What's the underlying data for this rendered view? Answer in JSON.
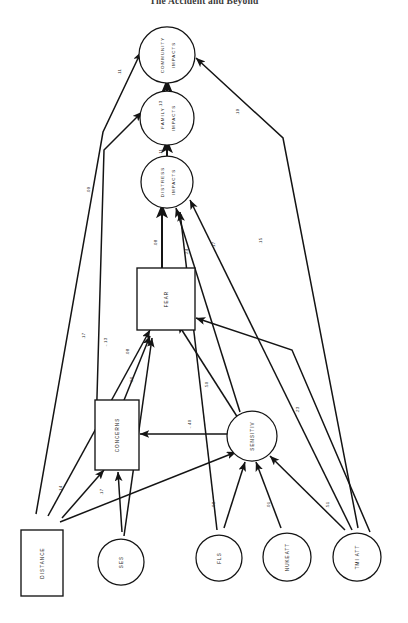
{
  "page": {
    "running_head": "The Accident and Beyond",
    "figure_type": "structural-equation-path-diagram",
    "orientation": "rotated-90-counterclockwise"
  },
  "diagram": {
    "nodes": [
      {
        "id": "community_impacts",
        "label": "COMMUNITY IMPACTS",
        "shape": "circle",
        "line1": "COMMUNITY",
        "line2": "IMPACTS"
      },
      {
        "id": "family_impacts",
        "label": "FAMILY IMPACTS",
        "shape": "circle",
        "line1": "FAMILY",
        "line2": "IMPACTS"
      },
      {
        "id": "distress_impacts",
        "label": "DISTRESS IMPACTS",
        "shape": "circle",
        "line1": "DISTRESS",
        "line2": "IMPACTS"
      },
      {
        "id": "fear",
        "label": "FEAR",
        "shape": "rect",
        "line1": "FEAR",
        "line2": ""
      },
      {
        "id": "concerns",
        "label": "CONCERNS",
        "shape": "rect",
        "line1": "CONCERNS",
        "line2": ""
      },
      {
        "id": "sensitiv",
        "label": "SENSITIV",
        "shape": "circle",
        "line1": "SENSITIV",
        "line2": ""
      },
      {
        "id": "distance",
        "label": "DISTANCE",
        "shape": "rect",
        "line1": "DISTANCE",
        "line2": ""
      },
      {
        "id": "ses",
        "label": "SES",
        "shape": "circle",
        "line1": "SES",
        "line2": ""
      },
      {
        "id": "fls",
        "label": "FLS",
        "shape": "circle",
        "line1": "FLS",
        "line2": ""
      },
      {
        "id": "nukeatt",
        "label": "NUKEATT",
        "shape": "circle",
        "line1": "NUKEATT",
        "line2": ""
      },
      {
        "id": "tmi_att",
        "label": "TMI ATT",
        "shape": "circle",
        "line1": "TMI ATT",
        "line2": ""
      }
    ],
    "paths": [
      {
        "id": "p1",
        "from": "distress_impacts",
        "to": "community_impacts",
        "coef": ".13"
      },
      {
        "id": "p2",
        "from": "distance",
        "to": "community_impacts",
        "coef": ".11"
      },
      {
        "id": "p3",
        "from": "tmi_att",
        "to": "community_impacts",
        "coef": ".19"
      },
      {
        "id": "p4",
        "from": "distress_impacts",
        "to": "family_impacts",
        "coef": ".11"
      },
      {
        "id": "p5",
        "from": "concerns",
        "to": "family_impacts",
        "coef": ".09"
      },
      {
        "id": "p6",
        "from": "fear",
        "to": "distress_impacts",
        "coef": ".08"
      },
      {
        "id": "p7",
        "from": "sensitiv",
        "to": "distress_impacts",
        "coef": ".24"
      },
      {
        "id": "p8",
        "from": "fls",
        "to": "distress_impacts",
        "coef": ".17"
      },
      {
        "id": "p9",
        "from": "tmi_att",
        "to": "distress_impacts",
        "coef": ".15"
      },
      {
        "id": "p10",
        "from": "distance",
        "to": "fear",
        "coef": ".17"
      },
      {
        "id": "p11",
        "from": "concerns",
        "to": "fear",
        "coef": "-.13"
      },
      {
        "id": "p12",
        "from": "ses",
        "to": "fear",
        "coef": ".08"
      },
      {
        "id": "p13",
        "from": "sensitiv",
        "to": "fear",
        "coef": ".50"
      },
      {
        "id": "p14",
        "from": "distance",
        "to": "concerns",
        "coef": ".14"
      },
      {
        "id": "p15",
        "from": "ses",
        "to": "concerns",
        "coef": ".17"
      },
      {
        "id": "p16",
        "from": "sensitiv",
        "to": "concerns",
        "coef": "-.40"
      },
      {
        "id": "p17",
        "from": "distance",
        "to": "sensitiv",
        "coef": ".06"
      },
      {
        "id": "p18",
        "from": "fls",
        "to": "sensitiv",
        "coef": ".08"
      },
      {
        "id": "p19",
        "from": "nukeatt",
        "to": "sensitiv",
        "coef": ".01"
      },
      {
        "id": "p20",
        "from": "tmi_att",
        "to": "sensitiv",
        "coef": ".51"
      },
      {
        "id": "p21",
        "from": "tmi_att",
        "to": "fear",
        "coef": ".23"
      }
    ]
  },
  "colors": {
    "ink": "#141414",
    "paper": "#ffffff",
    "coef_text": "#2b2b2b"
  }
}
